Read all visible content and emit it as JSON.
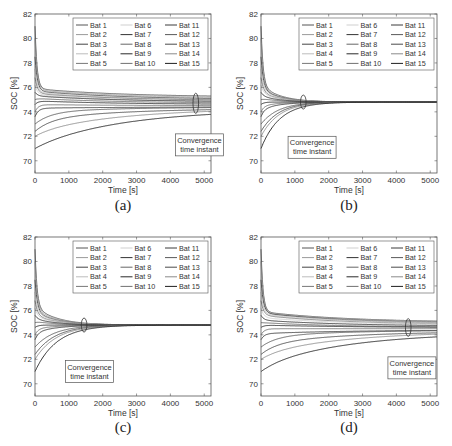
{
  "figure": {
    "panels": [
      {
        "id": "a",
        "caption": "(a)",
        "annotation": [
          "Convergence",
          "time instant"
        ],
        "convergence_time": 4750,
        "annotation_box": {
          "x": 4150,
          "y": 72.2
        }
      },
      {
        "id": "b",
        "caption": "(b)",
        "annotation": [
          "Convergence",
          "time instant"
        ],
        "convergence_time": 1250,
        "annotation_box": {
          "x": 800,
          "y": 72.0
        }
      },
      {
        "id": "c",
        "caption": "(c)",
        "annotation": [
          "Convergence",
          "time instant"
        ],
        "convergence_time": 1450,
        "annotation_box": {
          "x": 900,
          "y": 71.9
        }
      },
      {
        "id": "d",
        "caption": "(d)",
        "annotation": [
          "Convergence",
          "time instant"
        ],
        "convergence_time": 4350,
        "annotation_box": {
          "x": 3750,
          "y": 72.2
        }
      }
    ]
  },
  "chart_data": [
    {
      "type": "line",
      "title": "(a)",
      "xlabel": "Time [s]",
      "ylabel": "SOC [%]",
      "xlim": [
        0,
        5200
      ],
      "ylim": [
        69,
        82
      ],
      "xticks": [
        0,
        1000,
        2000,
        3000,
        4000,
        5000
      ],
      "yticks": [
        70,
        72,
        74,
        76,
        78,
        80,
        82
      ],
      "grid": false,
      "legend_position": "upper right (3 columns)",
      "legend": [
        "Bat 1",
        "Bat 2",
        "Bat 3",
        "Bat 4",
        "Bat 5",
        "Bat 6",
        "Bat 7",
        "Bat 8",
        "Bat 9",
        "Bat 10",
        "Bat 11",
        "Bat 12",
        "Bat 13",
        "Bat 14",
        "Bat 15"
      ],
      "annotation": "Convergence time instant",
      "convergence_time_s": 4750,
      "series": [
        {
          "name": "Bat 1",
          "initial": 81.0,
          "peak": 75.9,
          "final": 75.2
        },
        {
          "name": "Bat 2",
          "initial": 80.0,
          "peak": 75.8,
          "final": 75.1
        },
        {
          "name": "Bat 3",
          "initial": 78.5,
          "peak": 75.7,
          "final": 75.0
        },
        {
          "name": "Bat 4",
          "initial": 77.5,
          "peak": 75.6,
          "final": 74.9
        },
        {
          "name": "Bat 5",
          "initial": 76.8,
          "peak": 75.5,
          "final": 74.9
        },
        {
          "name": "Bat 6",
          "initial": 76.2,
          "peak": 75.4,
          "final": 74.8
        },
        {
          "name": "Bat 7",
          "initial": 75.6,
          "peak": 75.3,
          "final": 74.8
        },
        {
          "name": "Bat 8",
          "initial": 75.0,
          "peak": 75.1,
          "final": 74.7
        },
        {
          "name": "Bat 9",
          "initial": 74.6,
          "peak": 74.9,
          "final": 74.6
        },
        {
          "name": "Bat 10",
          "initial": 74.0,
          "peak": 74.6,
          "final": 74.5
        },
        {
          "name": "Bat 11",
          "initial": 73.6,
          "peak": 74.3,
          "final": 74.4
        },
        {
          "name": "Bat 12",
          "initial": 73.0,
          "peak": 74.0,
          "final": 74.4
        },
        {
          "name": "Bat 13",
          "initial": 72.4,
          "peak": 73.4,
          "final": 74.3
        },
        {
          "name": "Bat 14",
          "initial": 72.0,
          "peak": 72.4,
          "final": 74.3
        },
        {
          "name": "Bat 15",
          "initial": 71.0,
          "peak": 71.2,
          "final": 74.2
        }
      ]
    },
    {
      "type": "line",
      "title": "(b)",
      "xlabel": "Time [s]",
      "ylabel": "SOC [%]",
      "xlim": [
        0,
        5200
      ],
      "ylim": [
        69,
        82
      ],
      "xticks": [
        0,
        1000,
        2000,
        3000,
        4000,
        5000
      ],
      "yticks": [
        70,
        72,
        74,
        76,
        78,
        80,
        82
      ],
      "grid": false,
      "legend_position": "upper right (3 columns)",
      "legend": [
        "Bat 1",
        "Bat 2",
        "Bat 3",
        "Bat 4",
        "Bat 5",
        "Bat 6",
        "Bat 7",
        "Bat 8",
        "Bat 9",
        "Bat 10",
        "Bat 11",
        "Bat 12",
        "Bat 13",
        "Bat 14",
        "Bat 15"
      ],
      "annotation": "Convergence time instant",
      "convergence_time_s": 1250,
      "series": [
        {
          "name": "Bat 1",
          "initial": 81.0,
          "peak": 76.2,
          "final": 74.8
        },
        {
          "name": "Bat 2",
          "initial": 80.0,
          "peak": 76.0,
          "final": 74.8
        },
        {
          "name": "Bat 3",
          "initial": 78.5,
          "peak": 75.9,
          "final": 74.8
        },
        {
          "name": "Bat 4",
          "initial": 77.5,
          "peak": 75.8,
          "final": 74.8
        },
        {
          "name": "Bat 5",
          "initial": 76.8,
          "peak": 75.6,
          "final": 74.8
        },
        {
          "name": "Bat 6",
          "initial": 76.2,
          "peak": 75.5,
          "final": 74.8
        },
        {
          "name": "Bat 7",
          "initial": 75.6,
          "peak": 75.3,
          "final": 74.8
        },
        {
          "name": "Bat 8",
          "initial": 75.0,
          "peak": 75.1,
          "final": 74.8
        },
        {
          "name": "Bat 9",
          "initial": 74.6,
          "peak": 74.8,
          "final": 74.8
        },
        {
          "name": "Bat 10",
          "initial": 74.0,
          "peak": 74.5,
          "final": 74.8
        },
        {
          "name": "Bat 11",
          "initial": 73.6,
          "peak": 74.2,
          "final": 74.8
        },
        {
          "name": "Bat 12",
          "initial": 73.0,
          "peak": 73.9,
          "final": 74.8
        },
        {
          "name": "Bat 13",
          "initial": 72.4,
          "peak": 73.8,
          "final": 74.8
        },
        {
          "name": "Bat 14",
          "initial": 72.0,
          "peak": 73.2,
          "final": 74.8
        },
        {
          "name": "Bat 15",
          "initial": 71.0,
          "peak": 72.8,
          "final": 74.8
        }
      ]
    },
    {
      "type": "line",
      "title": "(c)",
      "xlabel": "Time [s]",
      "ylabel": "SOC [%]",
      "xlim": [
        0,
        5200
      ],
      "ylim": [
        69,
        82
      ],
      "xticks": [
        0,
        1000,
        2000,
        3000,
        4000,
        5000
      ],
      "yticks": [
        70,
        72,
        74,
        76,
        78,
        80,
        82
      ],
      "grid": false,
      "legend_position": "upper right (3 columns)",
      "legend": [
        "Bat 1",
        "Bat 2",
        "Bat 3",
        "Bat 4",
        "Bat 5",
        "Bat 6",
        "Bat 7",
        "Bat 8",
        "Bat 9",
        "Bat 10",
        "Bat 11",
        "Bat 12",
        "Bat 13",
        "Bat 14",
        "Bat 15"
      ],
      "annotation": "Convergence time instant",
      "convergence_time_s": 1450,
      "series": [
        {
          "name": "Bat 1",
          "initial": 81.0,
          "peak": 76.3,
          "final": 74.8
        },
        {
          "name": "Bat 2",
          "initial": 80.0,
          "peak": 76.1,
          "final": 74.8
        },
        {
          "name": "Bat 3",
          "initial": 78.5,
          "peak": 75.9,
          "final": 74.8
        },
        {
          "name": "Bat 4",
          "initial": 77.5,
          "peak": 75.8,
          "final": 74.8
        },
        {
          "name": "Bat 5",
          "initial": 76.8,
          "peak": 75.6,
          "final": 74.8
        },
        {
          "name": "Bat 6",
          "initial": 76.2,
          "peak": 75.5,
          "final": 74.8
        },
        {
          "name": "Bat 7",
          "initial": 75.6,
          "peak": 75.3,
          "final": 74.8
        },
        {
          "name": "Bat 8",
          "initial": 75.0,
          "peak": 75.1,
          "final": 74.8
        },
        {
          "name": "Bat 9",
          "initial": 74.6,
          "peak": 74.8,
          "final": 74.8
        },
        {
          "name": "Bat 10",
          "initial": 74.0,
          "peak": 74.5,
          "final": 74.8
        },
        {
          "name": "Bat 11",
          "initial": 73.6,
          "peak": 74.2,
          "final": 74.8
        },
        {
          "name": "Bat 12",
          "initial": 73.0,
          "peak": 73.7,
          "final": 74.8
        },
        {
          "name": "Bat 13",
          "initial": 72.4,
          "peak": 73.0,
          "final": 74.8
        },
        {
          "name": "Bat 14",
          "initial": 72.0,
          "peak": 72.4,
          "final": 74.8
        },
        {
          "name": "Bat 15",
          "initial": 71.0,
          "peak": 71.5,
          "final": 74.8
        }
      ]
    },
    {
      "type": "line",
      "title": "(d)",
      "xlabel": "Time [s]",
      "ylabel": "SOC [%]",
      "xlim": [
        0,
        5200
      ],
      "ylim": [
        69,
        82
      ],
      "xticks": [
        0,
        1000,
        2000,
        3000,
        4000,
        5000
      ],
      "yticks": [
        70,
        72,
        74,
        76,
        78,
        80,
        82
      ],
      "grid": false,
      "legend_position": "upper right (3 columns)",
      "legend": [
        "Bat 1",
        "Bat 2",
        "Bat 3",
        "Bat 4",
        "Bat 5",
        "Bat 6",
        "Bat 7",
        "Bat 8",
        "Bat 9",
        "Bat 10",
        "Bat 11",
        "Bat 12",
        "Bat 13",
        "Bat 14",
        "Bat 15"
      ],
      "annotation": "Convergence time instant",
      "convergence_time_s": 4350,
      "series": [
        {
          "name": "Bat 1",
          "initial": 81.0,
          "peak": 75.9,
          "final": 75.0
        },
        {
          "name": "Bat 2",
          "initial": 80.0,
          "peak": 75.8,
          "final": 75.0
        },
        {
          "name": "Bat 3",
          "initial": 78.5,
          "peak": 75.8,
          "final": 74.9
        },
        {
          "name": "Bat 4",
          "initial": 77.5,
          "peak": 75.7,
          "final": 74.9
        },
        {
          "name": "Bat 5",
          "initial": 76.8,
          "peak": 75.6,
          "final": 74.8
        },
        {
          "name": "Bat 6",
          "initial": 76.2,
          "peak": 75.4,
          "final": 74.8
        },
        {
          "name": "Bat 7",
          "initial": 75.6,
          "peak": 75.2,
          "final": 74.7
        },
        {
          "name": "Bat 8",
          "initial": 75.0,
          "peak": 75.0,
          "final": 74.6
        },
        {
          "name": "Bat 9",
          "initial": 74.6,
          "peak": 74.8,
          "final": 74.6
        },
        {
          "name": "Bat 10",
          "initial": 74.0,
          "peak": 74.5,
          "final": 74.5
        },
        {
          "name": "Bat 11",
          "initial": 73.6,
          "peak": 74.1,
          "final": 74.4
        },
        {
          "name": "Bat 12",
          "initial": 73.0,
          "peak": 73.9,
          "final": 74.4
        },
        {
          "name": "Bat 13",
          "initial": 72.4,
          "peak": 73.3,
          "final": 74.3
        },
        {
          "name": "Bat 14",
          "initial": 72.0,
          "peak": 72.5,
          "final": 74.3
        },
        {
          "name": "Bat 15",
          "initial": 71.0,
          "peak": 71.5,
          "final": 74.2
        }
      ]
    }
  ],
  "styles": {
    "series_colors": [
      "#555555",
      "#9a9a9a",
      "#444444",
      "#bdbdbd",
      "#777777",
      "#cfcfcf",
      "#333333",
      "#666666",
      "#2a2a2a",
      "#707070",
      "#3a3a3a",
      "#5a5a5a",
      "#4a4a4a",
      "#8a8a8a",
      "#1e1e1e"
    ],
    "axis_color": "#555555",
    "text_color": "#333333"
  }
}
